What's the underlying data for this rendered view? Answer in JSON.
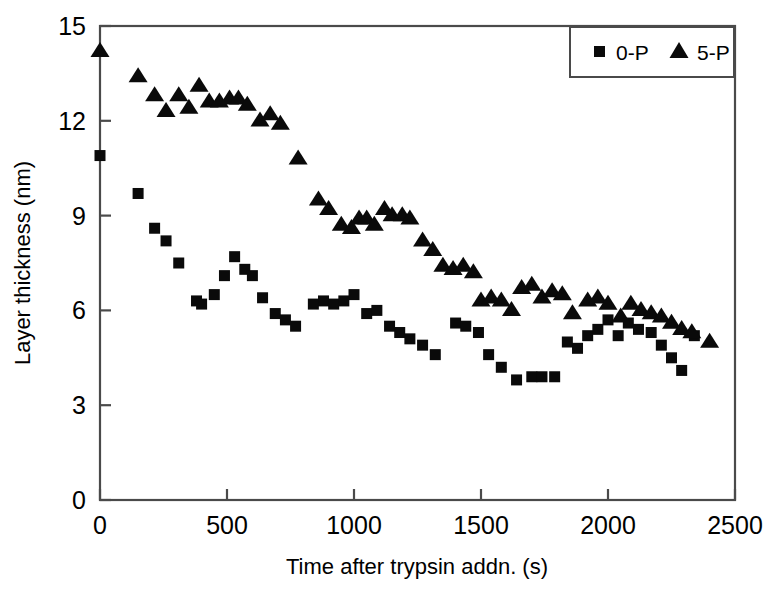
{
  "chart_data": {
    "type": "scatter",
    "title": "",
    "xlabel": "Time after trypsin addn. (s)",
    "ylabel": "Layer thickness (nm)",
    "xlim": [
      0,
      2500
    ],
    "ylim": [
      0,
      15
    ],
    "xticks": [
      0,
      500,
      1000,
      1500,
      2000,
      2500
    ],
    "yticks": [
      0,
      3,
      6,
      9,
      12,
      15
    ],
    "xtick_labels": [
      "0",
      "500",
      "1000",
      "1500",
      "2000",
      "2500"
    ],
    "ytick_labels": [
      "0",
      "3",
      "6",
      "9",
      "12",
      "15"
    ],
    "grid": false,
    "legend_position": "top-right",
    "series": [
      {
        "name": "0-P",
        "marker": "square",
        "color": "#0a0a0a",
        "points": [
          [
            0,
            10.9
          ],
          [
            150,
            9.7
          ],
          [
            215,
            8.6
          ],
          [
            260,
            8.2
          ],
          [
            310,
            7.5
          ],
          [
            380,
            6.3
          ],
          [
            400,
            6.2
          ],
          [
            450,
            6.5
          ],
          [
            490,
            7.1
          ],
          [
            530,
            7.7
          ],
          [
            570,
            7.3
          ],
          [
            600,
            7.1
          ],
          [
            640,
            6.4
          ],
          [
            690,
            5.9
          ],
          [
            730,
            5.7
          ],
          [
            770,
            5.5
          ],
          [
            840,
            6.2
          ],
          [
            880,
            6.3
          ],
          [
            920,
            6.2
          ],
          [
            960,
            6.3
          ],
          [
            1000,
            6.5
          ],
          [
            1050,
            5.9
          ],
          [
            1090,
            6.0
          ],
          [
            1140,
            5.5
          ],
          [
            1180,
            5.3
          ],
          [
            1220,
            5.1
          ],
          [
            1270,
            4.9
          ],
          [
            1320,
            4.6
          ],
          [
            1400,
            5.6
          ],
          [
            1440,
            5.5
          ],
          [
            1490,
            5.3
          ],
          [
            1530,
            4.6
          ],
          [
            1580,
            4.2
          ],
          [
            1640,
            3.8
          ],
          [
            1700,
            3.9
          ],
          [
            1740,
            3.9
          ],
          [
            1790,
            3.9
          ],
          [
            1840,
            5.0
          ],
          [
            1880,
            4.8
          ],
          [
            1920,
            5.2
          ],
          [
            1960,
            5.4
          ],
          [
            2000,
            5.7
          ],
          [
            2040,
            5.2
          ],
          [
            2080,
            5.6
          ],
          [
            2120,
            5.4
          ],
          [
            2170,
            5.3
          ],
          [
            2210,
            4.9
          ],
          [
            2250,
            4.5
          ],
          [
            2290,
            4.1
          ],
          [
            2340,
            5.2
          ]
        ]
      },
      {
        "name": "5-P",
        "marker": "triangle",
        "color": "#0a0a0a",
        "points": [
          [
            0,
            14.2
          ],
          [
            150,
            13.4
          ],
          [
            215,
            12.8
          ],
          [
            260,
            12.3
          ],
          [
            310,
            12.8
          ],
          [
            350,
            12.4
          ],
          [
            390,
            13.1
          ],
          [
            430,
            12.6
          ],
          [
            470,
            12.6
          ],
          [
            510,
            12.7
          ],
          [
            545,
            12.7
          ],
          [
            580,
            12.5
          ],
          [
            630,
            12.0
          ],
          [
            670,
            12.2
          ],
          [
            710,
            11.9
          ],
          [
            780,
            10.8
          ],
          [
            860,
            9.5
          ],
          [
            900,
            9.2
          ],
          [
            950,
            8.7
          ],
          [
            990,
            8.6
          ],
          [
            1020,
            8.9
          ],
          [
            1050,
            8.9
          ],
          [
            1080,
            8.7
          ],
          [
            1120,
            9.2
          ],
          [
            1150,
            9.0
          ],
          [
            1190,
            9.0
          ],
          [
            1220,
            8.9
          ],
          [
            1270,
            8.2
          ],
          [
            1310,
            7.9
          ],
          [
            1350,
            7.4
          ],
          [
            1390,
            7.3
          ],
          [
            1430,
            7.4
          ],
          [
            1470,
            7.2
          ],
          [
            1500,
            6.3
          ],
          [
            1540,
            6.4
          ],
          [
            1580,
            6.3
          ],
          [
            1620,
            6.0
          ],
          [
            1660,
            6.7
          ],
          [
            1700,
            6.8
          ],
          [
            1740,
            6.4
          ],
          [
            1780,
            6.6
          ],
          [
            1820,
            6.5
          ],
          [
            1860,
            5.9
          ],
          [
            1920,
            6.3
          ],
          [
            1960,
            6.4
          ],
          [
            2000,
            6.2
          ],
          [
            2050,
            5.8
          ],
          [
            2090,
            6.2
          ],
          [
            2130,
            6.0
          ],
          [
            2170,
            5.9
          ],
          [
            2210,
            5.8
          ],
          [
            2250,
            5.6
          ],
          [
            2290,
            5.4
          ],
          [
            2330,
            5.3
          ],
          [
            2400,
            5.0
          ]
        ]
      }
    ]
  },
  "legend": {
    "entries": [
      {
        "label": "0-P",
        "marker": "square"
      },
      {
        "label": "5-P",
        "marker": "triangle"
      }
    ]
  }
}
